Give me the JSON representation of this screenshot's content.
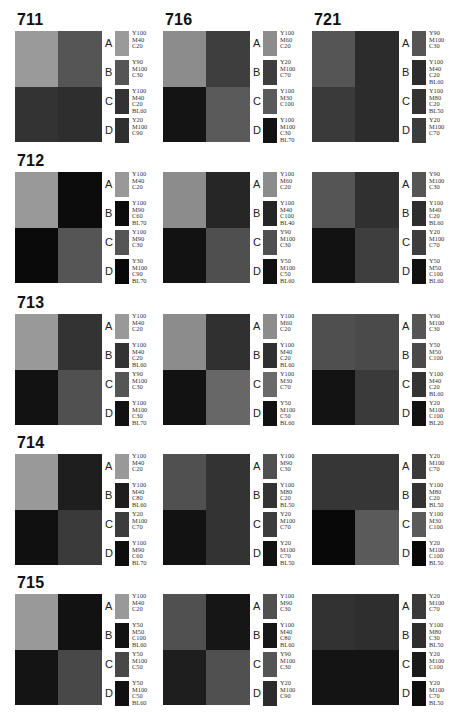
{
  "panels": [
    {
      "id": "711",
      "title": "711",
      "cells": [
        "#9a9a9a",
        "#555555",
        "#333333",
        "#2e2e2e"
      ],
      "legend": [
        {
          "letter": "A",
          "code": "Y100\nM40\nC20",
          "color": "#9a9a9a"
        },
        {
          "letter": "B",
          "code": "Y90\nM100\nC30",
          "color": "#555555"
        },
        {
          "letter": "C",
          "code": "Y100\nM40\nC20\nBL60",
          "color": "#333333"
        },
        {
          "letter": "D",
          "code": "Y20\nM100\nC90",
          "color": "#2f2f2f"
        }
      ]
    },
    {
      "id": "716",
      "title": "716",
      "cells": [
        "#8c8c8c",
        "#3e3e3e",
        "#141414",
        "#5a5a5a"
      ],
      "legend": [
        {
          "letter": "A",
          "code": "Y100\nM60\nC20",
          "color": "#8c8c8c"
        },
        {
          "letter": "B",
          "code": "Y20\nM100\nC70",
          "color": "#3e3e3e"
        },
        {
          "letter": "C",
          "code": "Y100\nM30\nC100",
          "color": "#5a5a5a"
        },
        {
          "letter": "D",
          "code": "Y100\nM100\nC30\nBL70",
          "color": "#121212"
        }
      ]
    },
    {
      "id": "721",
      "title": "721",
      "cells": [
        "#555555",
        "#2c2c2c",
        "#3a3a3a",
        "#2c2c2c"
      ],
      "legend": [
        {
          "letter": "A",
          "code": "Y90\nM100\nC30",
          "color": "#555555"
        },
        {
          "letter": "B",
          "code": "Y100\nM40\nC20\nBL60",
          "color": "#2c2c2c"
        },
        {
          "letter": "C",
          "code": "Y100\nM80\nC20\nBL50",
          "color": "#333333"
        },
        {
          "letter": "D",
          "code": "Y20\nM100\nC70",
          "color": "#3c3c3c"
        }
      ]
    },
    {
      "id": "712",
      "title": "712",
      "cells": [
        "#999999",
        "#0c0c0c",
        "#0a0a0a",
        "#555555"
      ],
      "legend": [
        {
          "letter": "A",
          "code": "Y100\nM40\nC20",
          "color": "#999999"
        },
        {
          "letter": "B",
          "code": "Y100\nM90\nC60\nBL70",
          "color": "#0c0c0c"
        },
        {
          "letter": "C",
          "code": "Y100\nM90\nC30",
          "color": "#555555"
        },
        {
          "letter": "D",
          "code": "Y30\nM100\nC90\nBL70",
          "color": "#080808"
        }
      ]
    },
    {
      "id": "716b",
      "title": "",
      "cells": [
        "#8c8c8c",
        "#262626",
        "#121212",
        "#4f4f4f"
      ],
      "legend": [
        {
          "letter": "A",
          "code": "Y100\nM60\nC20",
          "color": "#8c8c8c"
        },
        {
          "letter": "B",
          "code": "Y100\nM40\nC100\nBL40",
          "color": "#262626"
        },
        {
          "letter": "C",
          "code": "Y90\nM100\nC30",
          "color": "#505050"
        },
        {
          "letter": "D",
          "code": "Y50\nM100\nC50\nBL60",
          "color": "#111111"
        }
      ]
    },
    {
      "id": "721b",
      "title": "",
      "cells": [
        "#555555",
        "#303030",
        "#121212",
        "#3e3e3e"
      ],
      "legend": [
        {
          "letter": "A",
          "code": "Y90\nM100\nC30",
          "color": "#555555"
        },
        {
          "letter": "B",
          "code": "Y100\nM40\nC20\nBL60",
          "color": "#2e2e2e"
        },
        {
          "letter": "C",
          "code": "Y20\nM100\nC70",
          "color": "#3e3e3e"
        },
        {
          "letter": "D",
          "code": "Y50\nM50\nC100\nBL60",
          "color": "#111111"
        }
      ]
    },
    {
      "id": "713",
      "title": "713",
      "cells": [
        "#999999",
        "#333333",
        "#121212",
        "#505050"
      ],
      "legend": [
        {
          "letter": "A",
          "code": "Y100\nM40\nC20",
          "color": "#999999"
        },
        {
          "letter": "B",
          "code": "Y100\nM40\nC20\nBL60",
          "color": "#333333"
        },
        {
          "letter": "C",
          "code": "Y90\nM100\nC30",
          "color": "#555555"
        },
        {
          "letter": "D",
          "code": "Y100\nM100\nC30\nBL70",
          "color": "#121212"
        }
      ]
    },
    {
      "id": "716c",
      "title": "",
      "cells": [
        "#8c8c8c",
        "#303030",
        "#121212",
        "#676767"
      ],
      "legend": [
        {
          "letter": "A",
          "code": "Y100\nM60\nC20",
          "color": "#8c8c8c"
        },
        {
          "letter": "B",
          "code": "Y100\nM40\nC20\nBL60",
          "color": "#303030"
        },
        {
          "letter": "C",
          "code": "Y100\nM30\nC70",
          "color": "#6a6a6a"
        },
        {
          "letter": "D",
          "code": "Y50\nM100\nC50\nBL60",
          "color": "#111111"
        }
      ]
    },
    {
      "id": "721c",
      "title": "",
      "cells": [
        "#4f4f4f",
        "#4a4a4a",
        "#131313",
        "#3a3a3a"
      ],
      "legend": [
        {
          "letter": "A",
          "code": "Y90\nM100\nC30",
          "color": "#555555"
        },
        {
          "letter": "B",
          "code": "Y50\nM50\nC100",
          "color": "#4a4a4a"
        },
        {
          "letter": "C",
          "code": "Y100\nM40\nC20\nBL60",
          "color": "#343434"
        },
        {
          "letter": "D",
          "code": "Y20\nM100\nC100\nBL20",
          "color": "#121212"
        }
      ]
    },
    {
      "id": "714",
      "title": "714",
      "cells": [
        "#999999",
        "#1e1e1e",
        "#101010",
        "#3a3a3a"
      ],
      "legend": [
        {
          "letter": "A",
          "code": "Y100\nM40\nC20",
          "color": "#999999"
        },
        {
          "letter": "B",
          "code": "Y100\nM40\nC80\nBL60",
          "color": "#1e1e1e"
        },
        {
          "letter": "C",
          "code": "Y20\nM100\nC70",
          "color": "#3c3c3c"
        },
        {
          "letter": "D",
          "code": "Y100\nM90\nC60\nBL70",
          "color": "#0e0e0e"
        }
      ]
    },
    {
      "id": "716d",
      "title": "",
      "cells": [
        "#505050",
        "#333333",
        "#121212",
        "#333333"
      ],
      "legend": [
        {
          "letter": "A",
          "code": "Y100\nM90\nC30",
          "color": "#505050"
        },
        {
          "letter": "B",
          "code": "Y100\nM80\nC20\nBL50",
          "color": "#333333"
        },
        {
          "letter": "C",
          "code": "Y20\nM100\nC70",
          "color": "#3c3c3c"
        },
        {
          "letter": "D",
          "code": "Y20\nM100\nC70\nBL50",
          "color": "#121212"
        }
      ]
    },
    {
      "id": "721d",
      "title": "",
      "cells": [
        "#363636",
        "#363636",
        "#080808",
        "#5a5a5a"
      ],
      "legend": [
        {
          "letter": "A",
          "code": "Y20\nM100\nC70",
          "color": "#3a3a3a"
        },
        {
          "letter": "B",
          "code": "Y100\nM80\nC20\nBL50",
          "color": "#333333"
        },
        {
          "letter": "C",
          "code": "Y100\nM30\nC100",
          "color": "#5a5a5a"
        },
        {
          "letter": "D",
          "code": "Y20\nM100\nC100\nBL50",
          "color": "#080808"
        }
      ]
    },
    {
      "id": "715",
      "title": "715",
      "cells": [
        "#999999",
        "#121212",
        "#141414",
        "#484848"
      ],
      "legend": [
        {
          "letter": "A",
          "code": "Y100\nM40\nC20",
          "color": "#999999"
        },
        {
          "letter": "B",
          "code": "Y50\nM50\nC100\nBL60",
          "color": "#121212"
        },
        {
          "letter": "C",
          "code": "Y50\nM100\nC50",
          "color": "#484848"
        },
        {
          "letter": "D",
          "code": "Y50\nM100\nC50\nBL60",
          "color": "#111111"
        }
      ]
    },
    {
      "id": "716e",
      "title": "",
      "cells": [
        "#505050",
        "#161616",
        "#1e1e1e",
        "#505050"
      ],
      "legend": [
        {
          "letter": "A",
          "code": "Y100\nM90\nC30",
          "color": "#505050"
        },
        {
          "letter": "B",
          "code": "Y100\nM40\nC80\nBL60",
          "color": "#161616"
        },
        {
          "letter": "C",
          "code": "Y90\nM100\nC30",
          "color": "#555555"
        },
        {
          "letter": "D",
          "code": "Y20\nM100\nC90",
          "color": "#2c2c2c"
        }
      ]
    },
    {
      "id": "721e",
      "title": "",
      "cells": [
        "#323232",
        "#2e2e2e",
        "#141414",
        "#141414"
      ],
      "legend": [
        {
          "letter": "A",
          "code": "Y20\nM100\nC70",
          "color": "#3a3a3a"
        },
        {
          "letter": "B",
          "code": "Y100\nM80\nC30\nBL50",
          "color": "#2e2e2e"
        },
        {
          "letter": "C",
          "code": "Y20\nM100\nC100",
          "color": "#1a1a1a"
        },
        {
          "letter": "D",
          "code": "Y20\nM100\nC70\nBL50",
          "color": "#0e0e0e"
        }
      ]
    }
  ]
}
